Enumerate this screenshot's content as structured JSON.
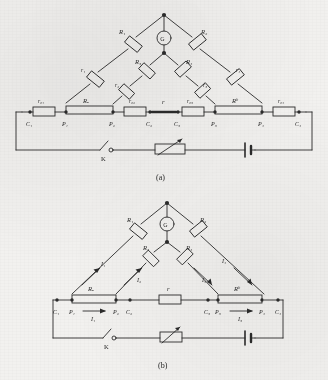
{
  "figure": {
    "ink_color": "#2b2b2b",
    "paper_color": "#f2f1ef",
    "captions": {
      "a": "(a)",
      "b": "(b)"
    }
  },
  "diagram_a": {
    "caption": "(a)",
    "galvanometer": "G",
    "bridge_arms": [
      {
        "name": "R1",
        "label": "R₁"
      },
      {
        "name": "R2",
        "label": "R₂"
      },
      {
        "name": "R3",
        "label": "R₃"
      },
      {
        "name": "R4",
        "label": "R₄"
      }
    ],
    "lead_resistances": [
      {
        "name": "r1",
        "label": "r₁"
      },
      {
        "name": "r2",
        "label": "r₂"
      },
      {
        "name": "r3",
        "label": "r₃"
      },
      {
        "name": "r4",
        "label": "r₄"
      }
    ],
    "contact_resistances": [
      {
        "name": "r01",
        "label": "r₀₁"
      },
      {
        "name": "r02",
        "label": "r₀₂"
      },
      {
        "name": "r03",
        "label": "r₀₃"
      },
      {
        "name": "r04",
        "label": "r₀₄"
      }
    ],
    "standard_resistors": [
      {
        "name": "RA",
        "label": "Rₐ"
      },
      {
        "name": "RB",
        "label": "Rᵇ"
      }
    ],
    "unknown_resistor": {
      "name": "r",
      "label": "r"
    },
    "terminals": [
      {
        "name": "C1",
        "label": "C₁"
      },
      {
        "name": "P1",
        "label": "P₁"
      },
      {
        "name": "P2",
        "label": "P₂"
      },
      {
        "name": "C2",
        "label": "C₂"
      },
      {
        "name": "C3",
        "label": "C₃"
      },
      {
        "name": "P3",
        "label": "P₃"
      },
      {
        "name": "P4",
        "label": "P₄"
      },
      {
        "name": "C4",
        "label": "C₄"
      }
    ],
    "switch": {
      "name": "K",
      "label": "K"
    },
    "rheostat": {
      "name": "rheostat",
      "label": ""
    },
    "battery": {
      "name": "battery",
      "label": ""
    }
  },
  "diagram_b": {
    "caption": "(b)",
    "galvanometer": "G",
    "bridge_arms": [
      {
        "name": "R1",
        "label": "R₁"
      },
      {
        "name": "R2",
        "label": "R₂"
      },
      {
        "name": "R3",
        "label": "R₃"
      },
      {
        "name": "R4",
        "label": "R₄"
      }
    ],
    "standard_resistors": [
      {
        "name": "RA",
        "label": "Rₐ"
      },
      {
        "name": "RB",
        "label": "Rᵇ"
      }
    ],
    "unknown_resistor": {
      "name": "r",
      "label": "r"
    },
    "terminals": [
      {
        "name": "C1",
        "label": "C₁"
      },
      {
        "name": "P1",
        "label": "P₁"
      },
      {
        "name": "P2",
        "label": "P₂"
      },
      {
        "name": "C2",
        "label": "C₂"
      },
      {
        "name": "C3",
        "label": "C₃"
      },
      {
        "name": "P3",
        "label": "P₃"
      },
      {
        "name": "P4",
        "label": "P₄"
      },
      {
        "name": "C4",
        "label": "C₄"
      }
    ],
    "currents": [
      {
        "name": "I1-left-branch",
        "label": "I₁"
      },
      {
        "name": "I2-inner-left",
        "label": "I₂"
      },
      {
        "name": "I3-inner-right",
        "label": "I₃"
      },
      {
        "name": "I4-right-branch",
        "label": "I₄"
      },
      {
        "name": "I1-rail-left",
        "label": "I₁"
      },
      {
        "name": "I3-rail-right",
        "label": "I₃"
      }
    ],
    "switch": {
      "name": "K",
      "label": "K"
    },
    "rheostat": {
      "name": "rheostat",
      "label": ""
    },
    "battery": {
      "name": "battery",
      "label": ""
    }
  }
}
